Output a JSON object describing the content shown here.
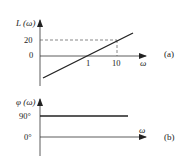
{
  "figure_a": {
    "y_label": "L (ω)",
    "x_label": "ω",
    "y_ticks": [
      "20",
      "0"
    ],
    "x_ticks": [
      "1",
      "10"
    ],
    "panel_label": "(a)"
  },
  "figure_b": {
    "y_label": "φ (ω)",
    "x_label": "ω",
    "y_ticks": [
      "90°",
      "0°"
    ],
    "panel_label": "(b)"
  },
  "colors": {
    "line": "#222222",
    "dashed": "#555555"
  }
}
